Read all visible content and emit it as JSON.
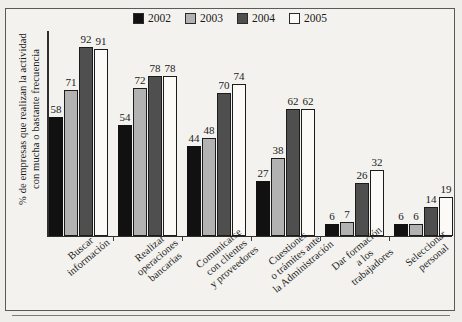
{
  "chart_data": {
    "type": "bar",
    "title": "",
    "subtitle": "",
    "xlabel": "",
    "ylabel": "% de empresas que realizan la actividad con mucha o bastante frecuencia",
    "ylabel_lines": [
      "% de empresas que realizan la actividad",
      "con mucha o bastante frecuencia"
    ],
    "ylim": [
      0,
      100
    ],
    "grid": false,
    "legend_position": "top-center",
    "categories": [
      "Buscar información",
      "Realizar operaciones bancarias",
      "Comunicarse con clientes y proveedores",
      "Cuestiones o trámites ante la Administración",
      "Dar formación a los trabajadores",
      "Seleccionar personal"
    ],
    "category_lines": [
      [
        "Buscar",
        "información"
      ],
      [
        "Realizar",
        "operaciones",
        "bancarias"
      ],
      [
        "Comunicarse",
        "con clientes",
        "y proveedores"
      ],
      [
        "Cuestiones",
        "o trámites ante",
        "la Administración"
      ],
      [
        "Dar formación",
        "a los",
        "trabajadores"
      ],
      [
        "Seleccionar",
        "personal"
      ]
    ],
    "series": [
      {
        "name": "2002",
        "color": "#111111",
        "values": [
          58,
          54,
          44,
          27,
          6,
          6
        ]
      },
      {
        "name": "2003",
        "color": "#b2b2b2",
        "values": [
          71,
          72,
          48,
          38,
          7,
          6
        ]
      },
      {
        "name": "2004",
        "color": "#4f4f4f",
        "values": [
          92,
          78,
          70,
          62,
          26,
          14
        ]
      },
      {
        "name": "2005",
        "color": "#fbfaf7",
        "values": [
          91,
          78,
          74,
          62,
          32,
          19
        ]
      }
    ]
  },
  "legend": {
    "items": [
      {
        "label": "2002",
        "color": "#111111"
      },
      {
        "label": "2003",
        "color": "#b2b2b2"
      },
      {
        "label": "2004",
        "color": "#4f4f4f"
      },
      {
        "label": "2005",
        "color": "#fbfaf7"
      }
    ]
  }
}
